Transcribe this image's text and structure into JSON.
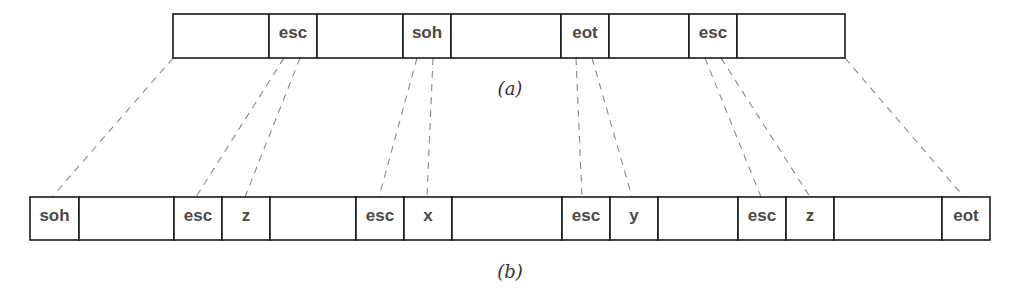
{
  "figure": {
    "top_frame": {
      "caption": "(a)",
      "y": 14,
      "height": 44,
      "cells": [
        {
          "x": 173,
          "w": 96,
          "label": ""
        },
        {
          "x": 269,
          "w": 48,
          "label": "esc"
        },
        {
          "x": 317,
          "w": 86,
          "label": ""
        },
        {
          "x": 403,
          "w": 48,
          "label": "soh"
        },
        {
          "x": 451,
          "w": 110,
          "label": ""
        },
        {
          "x": 561,
          "w": 48,
          "label": "eot"
        },
        {
          "x": 609,
          "w": 80,
          "label": ""
        },
        {
          "x": 689,
          "w": 48,
          "label": "esc"
        },
        {
          "x": 737,
          "w": 108,
          "label": ""
        }
      ]
    },
    "bottom_frame": {
      "caption": "(b)",
      "y": 197,
      "height": 43,
      "cells": [
        {
          "x": 30,
          "w": 49,
          "label": "soh"
        },
        {
          "x": 79,
          "w": 95,
          "label": ""
        },
        {
          "x": 174,
          "w": 48,
          "label": "esc"
        },
        {
          "x": 222,
          "w": 48,
          "label": "z"
        },
        {
          "x": 270,
          "w": 86,
          "label": ""
        },
        {
          "x": 356,
          "w": 48,
          "label": "esc"
        },
        {
          "x": 404,
          "w": 48,
          "label": "x"
        },
        {
          "x": 452,
          "w": 110,
          "label": ""
        },
        {
          "x": 562,
          "w": 48,
          "label": "esc"
        },
        {
          "x": 610,
          "w": 48,
          "label": "y"
        },
        {
          "x": 658,
          "w": 80,
          "label": ""
        },
        {
          "x": 738,
          "w": 48,
          "label": "esc"
        },
        {
          "x": 786,
          "w": 48,
          "label": "z"
        },
        {
          "x": 834,
          "w": 108,
          "label": ""
        },
        {
          "x": 942,
          "w": 48,
          "label": "eot"
        }
      ]
    },
    "mapping_lines": [
      {
        "from": [
          173,
          58
        ],
        "to": [
          52,
          197
        ]
      },
      {
        "from": [
          284,
          58
        ],
        "to": [
          196,
          197
        ]
      },
      {
        "from": [
          300,
          58
        ],
        "to": [
          245,
          197
        ]
      },
      {
        "from": [
          417,
          58
        ],
        "to": [
          379,
          197
        ]
      },
      {
        "from": [
          433,
          58
        ],
        "to": [
          427,
          197
        ]
      },
      {
        "from": [
          576,
          58
        ],
        "to": [
          582,
          197
        ]
      },
      {
        "from": [
          592,
          58
        ],
        "to": [
          632,
          197
        ]
      },
      {
        "from": [
          705,
          58
        ],
        "to": [
          761,
          197
        ]
      },
      {
        "from": [
          721,
          58
        ],
        "to": [
          810,
          197
        ]
      },
      {
        "from": [
          845,
          58
        ],
        "to": [
          964,
          197
        ]
      }
    ],
    "captions": {
      "a": {
        "text": "(a)",
        "x": 510,
        "y": 95
      },
      "b": {
        "text": "(b)",
        "x": 510,
        "y": 278
      }
    }
  }
}
